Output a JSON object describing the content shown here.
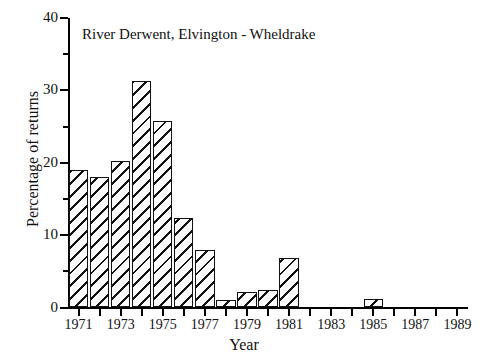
{
  "chart_data": {
    "type": "bar",
    "title": "River Derwent, Elvington - Wheldrake",
    "xlabel": "Year",
    "ylabel": "Percentage of returns",
    "xlim": [
      1970.5,
      1989.5
    ],
    "ylim": [
      0,
      40
    ],
    "grid": false,
    "legend": null,
    "y_major_ticks": [
      0,
      10,
      20,
      30,
      40
    ],
    "y_minor_ticks": [
      5,
      15,
      25,
      35
    ],
    "y_tick_labels": [
      "0",
      "10",
      "20",
      "30",
      "40"
    ],
    "x_tick_years": [
      1971,
      1972,
      1973,
      1974,
      1975,
      1976,
      1977,
      1978,
      1979,
      1980,
      1981,
      1982,
      1983,
      1984,
      1985,
      1986,
      1987,
      1988,
      1989
    ],
    "x_tick_labels": [
      "1971",
      "",
      "1973",
      "",
      "1975",
      "",
      "1977",
      "",
      "1979",
      "",
      "1981",
      "",
      "1983",
      "",
      "1985",
      "",
      "1987",
      "",
      "1989"
    ],
    "categories": [
      1971,
      1972,
      1973,
      1974,
      1975,
      1976,
      1977,
      1978,
      1979,
      1980,
      1981,
      1982,
      1983,
      1984,
      1985,
      1986,
      1987,
      1988,
      1989
    ],
    "values": [
      19.0,
      18.0,
      20.2,
      31.3,
      25.8,
      12.4,
      8.0,
      1.1,
      2.2,
      2.4,
      6.8,
      0,
      0,
      0,
      1.2,
      0,
      0,
      0,
      0
    ],
    "bar_fill": "diagonal-hatch",
    "bar_edge_color": "#111111",
    "bar_face_color": "#ffffff"
  }
}
